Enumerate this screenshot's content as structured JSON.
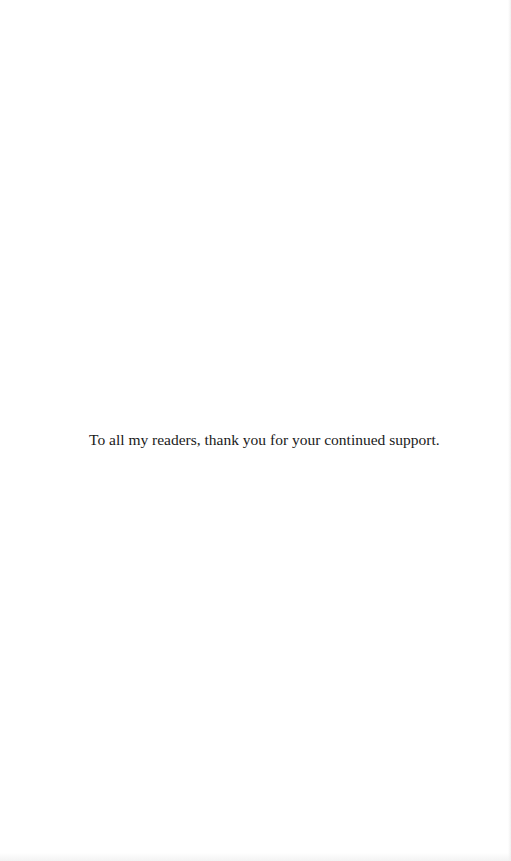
{
  "page": {
    "type": "dedication",
    "background": "#ffffff",
    "text_color": "#1a1a1a"
  },
  "dedication": {
    "text": "To all my readers, thank you for your continued support."
  }
}
